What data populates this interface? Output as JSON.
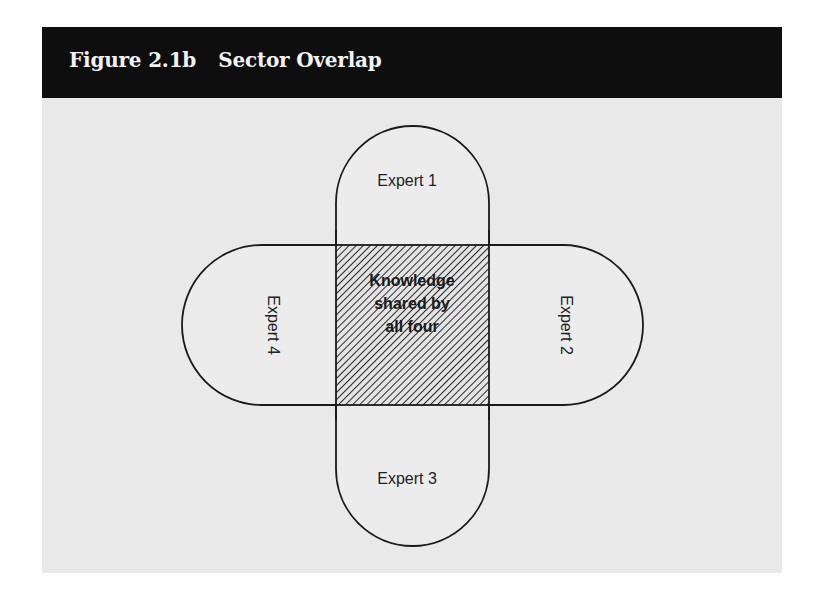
{
  "figure": {
    "number": "Figure 2.1b",
    "title": "Sector Overlap"
  },
  "diagram": {
    "type": "four-lobe overlap diagram",
    "lobes": [
      {
        "id": "top",
        "label": "Expert 1",
        "orientation": "horizontal"
      },
      {
        "id": "right",
        "label": "Expert 2",
        "orientation": "rotated-90-clockwise"
      },
      {
        "id": "bottom",
        "label": "Expert 3",
        "orientation": "horizontal"
      },
      {
        "id": "left",
        "label": "Expert 4",
        "orientation": "rotated-90-clockwise"
      }
    ],
    "center": {
      "lines": [
        "Knowledge",
        "shared by",
        "all four"
      ],
      "fill": "diagonal hatching"
    }
  },
  "colors": {
    "header_background": "#0e0e0e",
    "header_text": "#f2f2f2",
    "body_background": "#e9e9e9",
    "outline": "#1a1a1a"
  }
}
